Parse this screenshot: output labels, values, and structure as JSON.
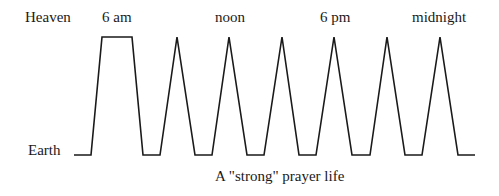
{
  "diagram": {
    "caption": "A \"strong\" prayer life",
    "y_labels": {
      "top": "Heaven",
      "bottom": "Earth"
    },
    "time_labels": [
      "6 am",
      "noon",
      "6 pm",
      "midnight"
    ],
    "line_color": "#1a1a1a",
    "background": "#ffffff"
  },
  "chart_data": {
    "type": "line",
    "title": "A \"strong\" prayer life",
    "y_levels": [
      "Earth",
      "Heaven"
    ],
    "x_annotations": [
      "6 am",
      "noon",
      "6 pm",
      "midnight"
    ],
    "points": [
      {
        "x": 74,
        "level": "Earth"
      },
      {
        "x": 91,
        "level": "Earth"
      },
      {
        "x": 102,
        "level": "Heaven"
      },
      {
        "x": 132,
        "level": "Heaven"
      },
      {
        "x": 143,
        "level": "Earth"
      },
      {
        "x": 160,
        "level": "Earth"
      },
      {
        "x": 177,
        "level": "Heaven"
      },
      {
        "x": 195,
        "level": "Earth"
      },
      {
        "x": 212,
        "level": "Earth"
      },
      {
        "x": 229,
        "level": "Heaven"
      },
      {
        "x": 247,
        "level": "Earth"
      },
      {
        "x": 264,
        "level": "Earth"
      },
      {
        "x": 282,
        "level": "Heaven"
      },
      {
        "x": 299,
        "level": "Earth"
      },
      {
        "x": 316,
        "level": "Earth"
      },
      {
        "x": 334,
        "level": "Heaven"
      },
      {
        "x": 352,
        "level": "Earth"
      },
      {
        "x": 370,
        "level": "Earth"
      },
      {
        "x": 387,
        "level": "Heaven"
      },
      {
        "x": 405,
        "level": "Earth"
      },
      {
        "x": 422,
        "level": "Earth"
      },
      {
        "x": 440,
        "level": "Heaven"
      },
      {
        "x": 458,
        "level": "Earth"
      },
      {
        "x": 475,
        "level": "Earth"
      }
    ]
  }
}
